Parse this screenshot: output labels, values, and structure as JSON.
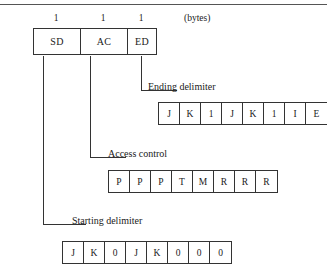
{
  "diagram": {
    "units_label": "(bytes)",
    "byte_counts": [
      "1",
      "1",
      "1"
    ],
    "frame_fields": [
      {
        "abbr": "SD",
        "name": "Starting delimiter",
        "bytes": "1"
      },
      {
        "abbr": "AC",
        "name": "Access control",
        "bytes": "1"
      },
      {
        "abbr": "ED",
        "name": "Ending delimiter",
        "bytes": "1"
      }
    ],
    "callouts": {
      "ending_delimiter": "Ending delimiter",
      "access_control": "Access control",
      "starting_delimiter": "Starting delimiter"
    },
    "expansions": {
      "ending_delimiter_bits": [
        "J",
        "K",
        "1",
        "J",
        "K",
        "1",
        "I",
        "E"
      ],
      "access_control_bits": [
        "P",
        "P",
        "P",
        "T",
        "M",
        "R",
        "R",
        "R"
      ],
      "starting_delimiter_bits": [
        "J",
        "K",
        "0",
        "J",
        "K",
        "0",
        "0",
        "0"
      ]
    },
    "colors": {
      "stroke": "#333333",
      "rule": "#555555",
      "text": "#1a1a1a",
      "background": "#ffffff"
    }
  }
}
